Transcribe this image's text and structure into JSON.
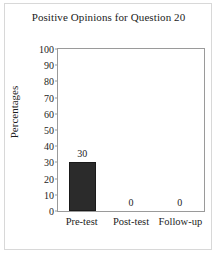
{
  "chart_data": {
    "type": "bar",
    "title": "Positive Opinions for Question 20",
    "xlabel": "",
    "ylabel": "Percentages",
    "categories": [
      "Pre-test",
      "Post-test",
      "Follow-up"
    ],
    "values": [
      30,
      0,
      0
    ],
    "data_labels": [
      "30",
      "0",
      "0"
    ],
    "ylim": [
      0,
      100
    ],
    "ytick_step": 10,
    "yticks": [
      0,
      10,
      20,
      30,
      40,
      50,
      60,
      70,
      80,
      90,
      100
    ],
    "ytick_labels": [
      "0",
      "10",
      "20",
      "30",
      "40",
      "50",
      "60",
      "70",
      "80",
      "90",
      "100"
    ],
    "grid": false,
    "legend": false,
    "bar_color": "#2b2b2b",
    "axis_color": "#9a9a9a",
    "background_color": "#ffffff"
  }
}
